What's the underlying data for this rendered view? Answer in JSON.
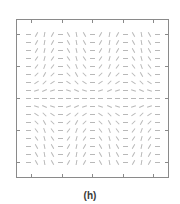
{
  "caption": "(h)",
  "colors": {
    "frame": "#8a8a8a",
    "segment": "#b8b8b8",
    "caption": "#3a3a3a"
  },
  "chart_data": {
    "type": "vector-field",
    "title": "(h)",
    "xlabel": "",
    "ylabel": "",
    "grid": false,
    "legend": "none",
    "frame_px": {
      "left": 16,
      "top": 19,
      "right": 169,
      "bottom": 178
    },
    "x_ticks_px": [
      31,
      62,
      92,
      123,
      153
    ],
    "y_ticks_px": [
      34,
      66,
      98,
      130,
      162
    ],
    "grid_origin_px": {
      "x": 28,
      "y": 34
    },
    "grid_step_px": {
      "x": 8.1,
      "y": 8.0
    },
    "rows": 17,
    "cols": 17,
    "segment_length_px": 5,
    "angles": [
      [
        0,
        60,
        80,
        60,
        0,
        -60,
        -80,
        -60,
        0,
        60,
        80,
        60,
        0,
        -60,
        -80,
        -60,
        0
      ],
      [
        0,
        60,
        80,
        60,
        0,
        -60,
        -80,
        -60,
        0,
        60,
        80,
        60,
        0,
        -60,
        -80,
        -60,
        0
      ],
      [
        0,
        59,
        78,
        59,
        0,
        -59,
        -78,
        -59,
        0,
        59,
        78,
        59,
        0,
        -59,
        -78,
        -59,
        0
      ],
      [
        0,
        56,
        75,
        56,
        0,
        -56,
        -75,
        -56,
        0,
        56,
        75,
        56,
        0,
        -56,
        -75,
        -56,
        0
      ],
      [
        0,
        53,
        70,
        53,
        0,
        -53,
        -70,
        -53,
        0,
        53,
        70,
        53,
        0,
        -53,
        -70,
        -53,
        0
      ],
      [
        0,
        45,
        60,
        45,
        0,
        -45,
        -60,
        -45,
        0,
        45,
        60,
        45,
        0,
        -45,
        -60,
        -45,
        0
      ],
      [
        0,
        34,
        45,
        34,
        0,
        -34,
        -45,
        -34,
        0,
        34,
        45,
        34,
        0,
        -34,
        -45,
        -34,
        0
      ],
      [
        0,
        19,
        25,
        19,
        0,
        -19,
        -25,
        -19,
        0,
        19,
        25,
        19,
        0,
        -19,
        -25,
        -19,
        0
      ],
      [
        0,
        0,
        0,
        0,
        0,
        0,
        0,
        0,
        0,
        0,
        0,
        0,
        0,
        0,
        0,
        0,
        0
      ],
      [
        0,
        -19,
        -25,
        -19,
        0,
        19,
        25,
        19,
        0,
        -19,
        -25,
        -19,
        0,
        19,
        25,
        19,
        0
      ],
      [
        0,
        -34,
        -45,
        -34,
        0,
        34,
        45,
        34,
        0,
        -34,
        -45,
        -34,
        0,
        34,
        45,
        34,
        0
      ],
      [
        0,
        -45,
        -60,
        -45,
        0,
        45,
        60,
        45,
        0,
        -45,
        -60,
        -45,
        0,
        45,
        60,
        45,
        0
      ],
      [
        0,
        -53,
        -70,
        -53,
        0,
        53,
        70,
        53,
        0,
        -53,
        -70,
        -53,
        0,
        53,
        70,
        53,
        0
      ],
      [
        0,
        -56,
        -75,
        -56,
        0,
        56,
        75,
        56,
        0,
        -56,
        -75,
        -56,
        0,
        56,
        75,
        56,
        0
      ],
      [
        0,
        -59,
        -78,
        -59,
        0,
        59,
        78,
        59,
        0,
        -59,
        -78,
        -59,
        0,
        59,
        78,
        59,
        0
      ],
      [
        0,
        -60,
        -80,
        -60,
        0,
        60,
        80,
        60,
        0,
        -60,
        -80,
        -60,
        0,
        60,
        80,
        60,
        0
      ],
      [
        0,
        -60,
        -80,
        -60,
        0,
        60,
        80,
        60,
        0,
        -60,
        -80,
        -60,
        0,
        60,
        80,
        60,
        0
      ]
    ]
  }
}
